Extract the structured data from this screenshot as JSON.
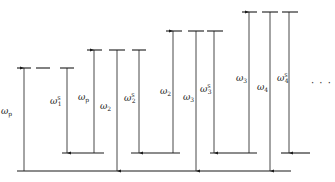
{
  "diagram": {
    "type": "energy-level-diagram",
    "line_color": "#1a1a1a",
    "ground_level": {
      "y": 171,
      "x1": 17,
      "x2": 291
    },
    "groups": [
      {
        "top_y": 68,
        "lower_level": {
          "y": 153,
          "x1": 62,
          "x2": 104
        },
        "dashes": [
          [
            17,
            31
          ],
          [
            36,
            50
          ],
          [
            60,
            74
          ]
        ],
        "arrows": [
          {
            "x": 24,
            "from": "ground",
            "to": "top",
            "dir": "up",
            "label": "ω",
            "sub": "p",
            "sup": "",
            "label_x": 1,
            "label_y": 114
          },
          {
            "x": 67,
            "from": "top",
            "to": "lower",
            "dir": "down",
            "label": "ω",
            "sub": "1",
            "sup": "S",
            "label_x": 50,
            "label_y": 104
          }
        ]
      },
      {
        "top_y": 50,
        "lower_level": {
          "y": 153,
          "x1": 131,
          "x2": 180
        },
        "dashes": [
          [
            87,
            102
          ],
          [
            109,
            125
          ],
          [
            132,
            146
          ]
        ],
        "arrows": [
          {
            "x": 94,
            "from": "lower",
            "to": "top",
            "dir": "up",
            "label": "ω",
            "sub": "p",
            "sup": "",
            "label_x": 78,
            "label_y": 100
          },
          {
            "x": 117,
            "from": "top",
            "to": "ground",
            "dir": "down",
            "label": "ω",
            "sub": "2",
            "sup": "",
            "label_x": 100,
            "label_y": 109
          },
          {
            "x": 139,
            "from": "top",
            "to": "lower",
            "dir": "down",
            "label": "ω",
            "sub": "2",
            "sup": "S",
            "label_x": 124,
            "label_y": 101
          }
        ]
      },
      {
        "top_y": 31,
        "lower_level": {
          "y": 153,
          "x1": 210,
          "x2": 257
        },
        "dashes": [
          [
            166,
            182
          ],
          [
            188,
            204
          ],
          [
            207,
            223
          ]
        ],
        "arrows": [
          {
            "x": 173,
            "from": "lower",
            "to": "top",
            "dir": "up",
            "label": "ω",
            "sub": "2",
            "sup": "",
            "label_x": 160,
            "label_y": 94
          },
          {
            "x": 196,
            "from": "top",
            "to": "ground",
            "dir": "down",
            "label": "ω",
            "sub": "3",
            "sup": "",
            "label_x": 183,
            "label_y": 100
          },
          {
            "x": 214,
            "from": "top",
            "to": "lower",
            "dir": "down",
            "label": "ω",
            "sub": "3",
            "sup": "S",
            "label_x": 200,
            "label_y": 92
          }
        ]
      },
      {
        "top_y": 12,
        "lower_level": {
          "y": 153,
          "x1": 281,
          "x2": 310
        },
        "dashes": [
          [
            242,
            257
          ],
          [
            262,
            278
          ],
          [
            282,
            298
          ]
        ],
        "arrows": [
          {
            "x": 249,
            "from": "lower",
            "to": "top",
            "dir": "up",
            "label": "ω",
            "sub": "3",
            "sup": "",
            "label_x": 236,
            "label_y": 81
          },
          {
            "x": 270,
            "from": "top",
            "to": "ground",
            "dir": "down",
            "label": "ω",
            "sub": "4",
            "sup": "",
            "label_x": 257,
            "label_y": 90
          },
          {
            "x": 289,
            "from": "top",
            "to": "lower",
            "dir": "down",
            "label": "ω",
            "sub": "4",
            "sup": "S",
            "label_x": 277,
            "label_y": 81
          }
        ]
      }
    ],
    "ellipsis": {
      "text": "· · ·",
      "x": 311,
      "y": 86
    }
  }
}
